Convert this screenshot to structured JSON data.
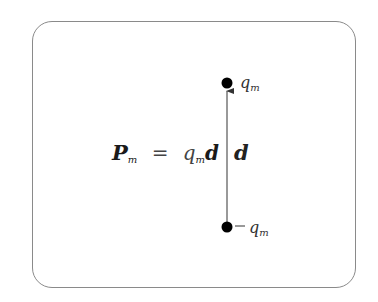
{
  "diagram": {
    "equation": {
      "lhs_symbol": "P",
      "lhs_subscript": "m",
      "operator": "=",
      "rhs_charge": "q",
      "rhs_charge_subscript": "m",
      "rhs_vector": "d"
    },
    "vector_label": "d",
    "top_charge": {
      "sign": "",
      "symbol": "q",
      "subscript": "m"
    },
    "bottom_charge": {
      "sign": "−",
      "symbol": "q",
      "subscript": "m"
    },
    "colors": {
      "frame": "#8a8a8a",
      "arrow": "#555555",
      "charge": "#000000"
    }
  }
}
